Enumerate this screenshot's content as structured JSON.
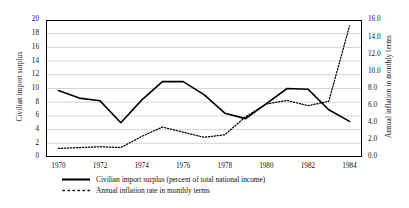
{
  "chart_data": {
    "type": "line",
    "title": "",
    "xlabel": "",
    "ylabel": "Civilian import surplus",
    "y2label": "Annual inflation in monthly terms",
    "x": [
      1970,
      1971,
      1972,
      1973,
      1974,
      1975,
      1976,
      1977,
      1978,
      1979,
      1980,
      1981,
      1982,
      1983,
      1984
    ],
    "xlim": [
      1969.4,
      1984.6
    ],
    "ylim": [
      0,
      20
    ],
    "y2lim": [
      0.0,
      16.0
    ],
    "xticks": [
      "1970",
      "1972",
      "1974",
      "1976",
      "1978",
      "1980",
      "1982",
      "1984"
    ],
    "xtick_values": [
      1970,
      1972,
      1974,
      1976,
      1978,
      1980,
      1982,
      1984
    ],
    "yticks": [
      "0",
      "2",
      "4",
      "6",
      "8",
      "10",
      "12",
      "14",
      "16",
      "18",
      "20"
    ],
    "ytick_values": [
      0,
      2,
      4,
      6,
      8,
      10,
      12,
      14,
      16,
      18,
      20
    ],
    "y2ticks": [
      "0.0",
      "2.0",
      "4.0",
      "6.0",
      "8.0",
      "10.0",
      "12.0",
      "14.0",
      "16.0"
    ],
    "y2tick_values": [
      0.0,
      2.0,
      4.0,
      6.0,
      8.0,
      10.0,
      12.0,
      14.0,
      16.0
    ],
    "grid": true,
    "grid_axis": "y",
    "legend_position": "below",
    "series": [
      {
        "name": "Civilian import surplus (percent of total national income)",
        "axis": "left",
        "style": "solid",
        "color": "#000000",
        "values": [
          9.7,
          8.6,
          8.2,
          5.0,
          8.3,
          11.0,
          11.0,
          9.1,
          6.4,
          5.6,
          7.8,
          10.0,
          9.9,
          6.9,
          5.2
        ]
      },
      {
        "name": "Annual inflation rate in monthly terms",
        "axis": "right",
        "style": "dotted",
        "color": "#000000",
        "values": [
          1.0,
          1.1,
          1.2,
          1.1,
          2.4,
          3.5,
          2.9,
          2.3,
          2.6,
          4.7,
          6.2,
          6.6,
          6.0,
          6.5,
          15.3
        ]
      }
    ]
  },
  "legend": {
    "entries": [
      {
        "key": "solid-line-key",
        "label": "Civilian import surplus (percent of total national income)"
      },
      {
        "key": "dotted-line-key",
        "label": "Annual inflation rate in monthly terms"
      }
    ]
  }
}
